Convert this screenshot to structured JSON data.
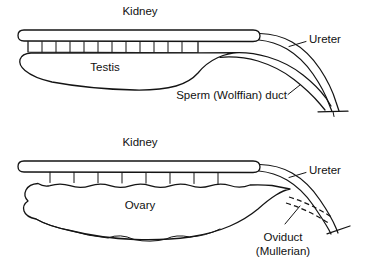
{
  "figure": {
    "type": "anatomical-diagram",
    "background_color": "#ffffff",
    "line_color": "#141414",
    "panels": [
      {
        "id": "male",
        "position": "top",
        "labels": {
          "kidney": "Kidney",
          "gonad": "Testis",
          "ureter": "Ureter",
          "duct": "Sperm (Wolffian) duct"
        }
      },
      {
        "id": "female",
        "position": "bottom",
        "labels": {
          "kidney": "Kidney",
          "gonad": "Ovary",
          "ureter": "Ureter",
          "duct_line1": "Oviduct",
          "duct_line2": "(Mullerian)"
        }
      }
    ]
  },
  "male_panel": {
    "kidney_label": "Kidney",
    "testis_label": "Testis",
    "ureter_label": "Ureter",
    "sperm_duct_label": "Sperm (Wolffian) duct"
  },
  "female_panel": {
    "kidney_label": "Kidney",
    "ovary_label": "Ovary",
    "ureter_label": "Ureter",
    "oviduct_label_line1": "Oviduct",
    "oviduct_label_line2": "(Mullerian)"
  }
}
